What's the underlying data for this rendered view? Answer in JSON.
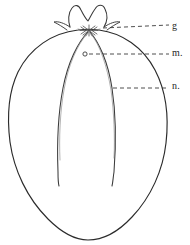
{
  "figure": {
    "type": "line-drawing",
    "background_color": "#ffffff",
    "ink_color": "#262626",
    "width": 190,
    "height": 245,
    "parts": {
      "outline_name": "fruit-outline",
      "crown_name": "calyx-crown",
      "starburst_name": "calyx-starburst",
      "inner_cavity_name": "inner-cavity-outline",
      "marker_name": "point-marker-o"
    },
    "marker": {
      "symbol": "o",
      "x": 85,
      "y": 54
    },
    "labels": [
      {
        "id": "g",
        "text": "g",
        "leader_from_x": 105,
        "leader_from_y": 28,
        "leader_to_x": 169,
        "leader_to_y": 26
      },
      {
        "id": "m",
        "text": "m.",
        "leader_from_x": 89,
        "leader_from_y": 54,
        "leader_to_x": 169,
        "leader_to_y": 54
      },
      {
        "id": "n",
        "text": "n.",
        "leader_from_x": 113,
        "leader_from_y": 88,
        "leader_to_x": 169,
        "leader_to_y": 88
      }
    ]
  }
}
